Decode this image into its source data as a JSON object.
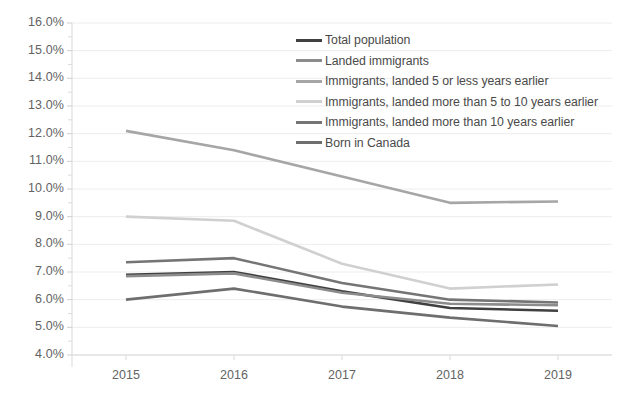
{
  "chart_data": {
    "type": "line",
    "title": "",
    "xlabel": "",
    "ylabel": "",
    "categories": [
      "2015",
      "2016",
      "2017",
      "2018",
      "2019"
    ],
    "x": [
      2015,
      2016,
      2017,
      2018,
      2019
    ],
    "ylim": [
      4.0,
      16.0
    ],
    "ytick_step": 1.0,
    "ytick_labels": [
      "16.0%",
      "15.0%",
      "14.0%",
      "13.0%",
      "12.0%",
      "11.0%",
      "10.0%",
      "9.0%",
      "8.0%",
      "7.0%",
      "6.0%",
      "5.0%",
      "4.0%"
    ],
    "ytick_values": [
      16.0,
      15.0,
      14.0,
      13.0,
      12.0,
      11.0,
      10.0,
      9.0,
      8.0,
      7.0,
      6.0,
      5.0,
      4.0
    ],
    "xtick_labels": [
      "2015",
      "2016",
      "2017",
      "2018",
      "2019"
    ],
    "grid": true,
    "grid_axis": "y",
    "legend_position": "inside-top-center",
    "units": "percent",
    "series": [
      {
        "name": "Total population",
        "color": "#404040",
        "values": [
          6.9,
          7.0,
          6.3,
          5.7,
          5.6
        ]
      },
      {
        "name": "Landed immigrants",
        "color": "#8c8c8c",
        "values": [
          6.85,
          6.95,
          6.25,
          5.85,
          5.8
        ]
      },
      {
        "name": "Immigrants, landed 5 or less years earlier",
        "color": "#a6a6a6",
        "values": [
          12.1,
          11.4,
          10.45,
          9.5,
          9.55
        ]
      },
      {
        "name": "Immigrants, landed more than 5 to 10 years earlier",
        "color": "#d0d0d0",
        "values": [
          9.0,
          8.85,
          7.3,
          6.4,
          6.55
        ]
      },
      {
        "name": "Immigrants, landed more than 10 years earlier",
        "color": "#757575",
        "values": [
          7.35,
          7.5,
          6.6,
          6.0,
          5.9
        ]
      },
      {
        "name": "Born in Canada",
        "color": "#6e6e6e",
        "values": [
          6.0,
          6.4,
          5.75,
          5.35,
          5.05
        ]
      }
    ]
  }
}
